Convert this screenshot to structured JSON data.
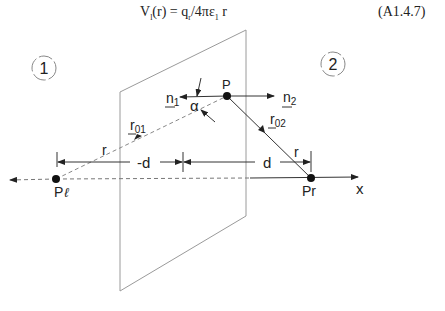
{
  "equation": {
    "lhs": "V",
    "lhs_sub": "l",
    "arg": "(r) = q",
    "q_sub": "r",
    "mid": "/4πε",
    "eps_sub": "1",
    "tail": " r",
    "number": "(A1.4.7)"
  },
  "diagram": {
    "regions": [
      "1",
      "2"
    ],
    "points": {
      "p": "P",
      "p_left": "P",
      "p_left_sub": "ℓ",
      "p_right": "Pr"
    },
    "vectors": {
      "n1": "n",
      "n1_sub": "1",
      "n2": "n",
      "n2_sub": "2",
      "r01": "r",
      "r01_sub": "01",
      "r02": "r",
      "r02_sub": "02"
    },
    "angle": "α",
    "distances": {
      "left_r": "r",
      "right_r": "r",
      "neg_d": "-d",
      "d": "d"
    },
    "axis": "x",
    "colors": {
      "line": "#333333",
      "plane": "#999999",
      "dashed": "#888888"
    }
  }
}
